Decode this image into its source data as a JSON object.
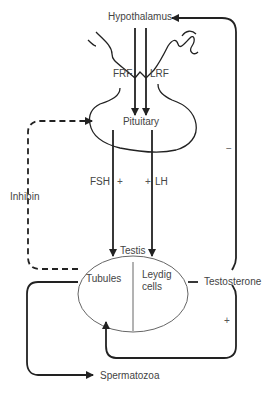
{
  "diagram": {
    "nodes": {
      "hypothalamus": "Hypothalamus",
      "pituitary": "Pituitary",
      "testis": "Testis",
      "tubules": "Tubules",
      "leydig_line1": "Leydig",
      "leydig_line2": "cells",
      "testosterone": "Testosterone",
      "spermatozoa": "Spermatozoa",
      "inhibin": "Inhibin"
    },
    "hormones": {
      "frf": "FRF",
      "lrf": "LRF",
      "fsh": "FSH",
      "lh": "LH"
    },
    "signs": {
      "fsh_sign": "+",
      "lh_sign": "+",
      "testosterone_negative": "−",
      "testosterone_positive": "+"
    },
    "edges": [
      {
        "from": "Hypothalamus",
        "to": "Pituitary",
        "label": "FRF",
        "style": "solid"
      },
      {
        "from": "Hypothalamus",
        "to": "Pituitary",
        "label": "LRF",
        "style": "solid"
      },
      {
        "from": "Pituitary",
        "to": "Tubules",
        "label": "FSH",
        "sign": "+",
        "style": "solid"
      },
      {
        "from": "Pituitary",
        "to": "Leydig cells",
        "label": "LH",
        "sign": "+",
        "style": "solid"
      },
      {
        "from": "Tubules",
        "to": "Pituitary",
        "label": "Inhibin",
        "sign": "−",
        "style": "dashed"
      },
      {
        "from": "Testosterone",
        "to": "Hypothalamus",
        "sign": "−",
        "style": "solid"
      },
      {
        "from": "Testosterone",
        "to": "Tubules",
        "sign": "+",
        "style": "solid"
      },
      {
        "from": "Tubules",
        "to": "Spermatozoa",
        "style": "solid"
      }
    ]
  }
}
